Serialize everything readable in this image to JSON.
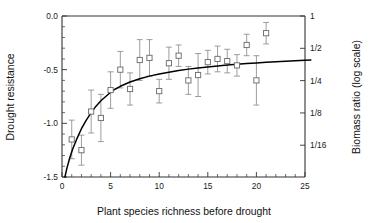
{
  "chart_data": {
    "type": "scatter",
    "title": "",
    "xlabel": "Plant species richness before drought",
    "ylabel": "Drought resistance",
    "y2label": "Biomass ratio (log scale)",
    "xlim": [
      0,
      25
    ],
    "ylim": [
      -1.5,
      0.0
    ],
    "grid": false,
    "legend": null,
    "x_ticks": [
      0,
      5,
      10,
      15,
      20,
      25
    ],
    "x_tick_labels": [
      "0",
      "5",
      "10",
      "15",
      "20",
      "25"
    ],
    "x_minor_tick_step": 1,
    "y_ticks": [
      0.0,
      -0.5,
      -1.0,
      -1.5
    ],
    "y_tick_labels": [
      "0.0",
      "-0.5",
      "-1.0",
      "-1.5"
    ],
    "y_minor_tick_step": 0.1,
    "y2_ticks": [
      0.0,
      -0.301,
      -0.602,
      -0.903,
      -1.204
    ],
    "y2_tick_labels": [
      "1",
      "1/2",
      "1/4",
      "1/8",
      "1/16"
    ],
    "marker_style": "open-square",
    "error_bar_style": "vertical-capped",
    "series": [
      {
        "name": "Drought resistance by species richness",
        "x": [
          1,
          2,
          3,
          4,
          5,
          6,
          7,
          8,
          9,
          10,
          11,
          12,
          13,
          14,
          15,
          16,
          17,
          18,
          19,
          20,
          21
        ],
        "values": [
          -1.15,
          -1.25,
          -0.89,
          -0.95,
          -0.69,
          -0.5,
          -0.68,
          -0.41,
          -0.39,
          -0.7,
          -0.44,
          -0.37,
          -0.6,
          -0.55,
          -0.43,
          -0.4,
          -0.42,
          -0.46,
          -0.27,
          -0.6,
          -0.16
        ],
        "err_low": [
          0.18,
          0.14,
          0.2,
          0.22,
          0.17,
          0.17,
          0.15,
          0.19,
          0.17,
          0.11,
          0.15,
          0.1,
          0.13,
          0.2,
          0.11,
          0.12,
          0.11,
          0.1,
          0.1,
          0.23,
          0.1
        ],
        "err_high": [
          0.18,
          0.14,
          0.2,
          0.22,
          0.17,
          0.17,
          0.15,
          0.19,
          0.17,
          0.11,
          0.15,
          0.1,
          0.13,
          0.2,
          0.11,
          0.12,
          0.11,
          0.1,
          0.1,
          0.23,
          0.1
        ]
      }
    ],
    "fit_curve": {
      "name": "fitted asymptotic curve",
      "description": "monotonic rising saturating curve",
      "x": [
        0.3,
        0.5,
        0.8,
        1.1,
        1.5,
        2.0,
        2.5,
        3.0,
        3.5,
        4.0,
        4.5,
        5.0,
        5.5,
        6.0,
        7.0,
        8.0,
        9.0,
        10.0,
        11.0,
        12.0,
        13.0,
        14.0,
        15.0,
        16.0,
        17.0,
        18.0,
        19.0,
        20.0,
        21.0,
        22.0,
        23.0,
        24.0,
        25.0,
        25.6
      ],
      "values": [
        -1.5,
        -1.42,
        -1.32,
        -1.24,
        -1.15,
        -1.05,
        -0.97,
        -0.9,
        -0.84,
        -0.79,
        -0.75,
        -0.71,
        -0.68,
        -0.655,
        -0.615,
        -0.585,
        -0.56,
        -0.54,
        -0.523,
        -0.508,
        -0.495,
        -0.484,
        -0.474,
        -0.465,
        -0.457,
        -0.45,
        -0.443,
        -0.437,
        -0.431,
        -0.426,
        -0.421,
        -0.417,
        -0.413,
        -0.411
      ]
    }
  },
  "figure": {
    "axis_titles": {
      "x": "Plant species richness before drought",
      "y_left": "Drought resistance",
      "y_right": "Biomass ratio (log scale)"
    }
  }
}
